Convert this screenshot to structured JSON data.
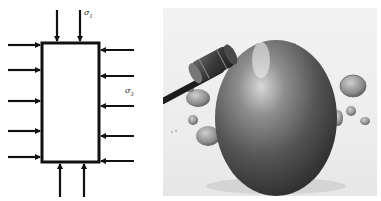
{
  "diagram": {
    "labels": {
      "sigma1": "σ",
      "sigma1_sub": "1",
      "sigma3": "σ",
      "sigma3_sub": "3"
    },
    "box": {
      "x": 42,
      "y": 43,
      "w": 57,
      "h": 119
    },
    "arrows_top_x": [
      57,
      80
    ],
    "arrows_bottom_x": [
      60,
      84
    ],
    "arrows_left_y": [
      45,
      70,
      101,
      131,
      157
    ],
    "arrows_right_y": [
      50,
      76,
      106,
      136,
      161
    ],
    "stroke_color": "#111111"
  },
  "photo": {
    "subject": "gavel striking a large metallic egg surrounded by coins",
    "objects": [
      "gavel",
      "egg",
      "coins"
    ]
  }
}
